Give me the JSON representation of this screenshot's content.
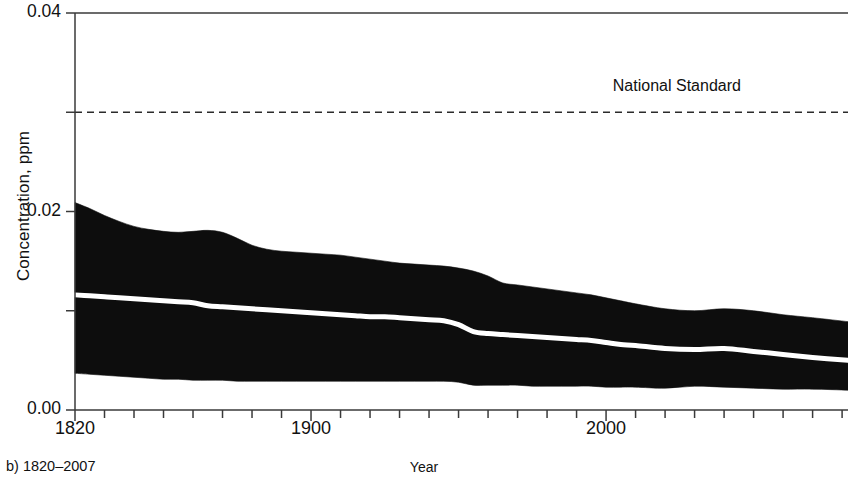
{
  "chart_data": {
    "type": "area",
    "title": "",
    "subtitle": "",
    "caption": "b) 1820–2007",
    "xlabel": "Year",
    "ylabel": "Concentration, ppm",
    "xlim": [
      1820,
      2082
    ],
    "ylim": [
      0.0,
      0.04
    ],
    "xticks_major": [
      1820,
      1900,
      2000
    ],
    "xtick_labels": [
      "1820",
      "1900",
      "2000"
    ],
    "xtick_minor_step": 10,
    "yticks_major": [
      0.0,
      0.02,
      0.04
    ],
    "ytick_labels": [
      "0.00",
      "0.02",
      "0.04"
    ],
    "yticks_minor": [
      0.01,
      0.03
    ],
    "grid": false,
    "legend_position": "none",
    "annotations": [
      {
        "label": "National Standard",
        "value": 0.03,
        "style": "dashed-horizontal-line",
        "label_x_year": 2005,
        "label_y_value": 0.0325
      }
    ],
    "series": [
      {
        "name": "Upper bound",
        "kind": "band-upper",
        "x": [
          1820,
          1825,
          1830,
          1835,
          1840,
          1845,
          1850,
          1855,
          1860,
          1865,
          1870,
          1875,
          1880,
          1885,
          1890,
          1895,
          1900,
          1905,
          1910,
          1915,
          1920,
          1925,
          1930,
          1935,
          1940,
          1945,
          1950,
          1955,
          1960,
          1965,
          1970,
          1975,
          1980,
          1985,
          1990,
          1995,
          2000,
          2005,
          2010,
          2020,
          2030,
          2040,
          2050,
          2060,
          2070,
          2082
        ],
        "values": [
          0.0209,
          0.0203,
          0.0196,
          0.019,
          0.0185,
          0.0182,
          0.018,
          0.0179,
          0.018,
          0.0181,
          0.0179,
          0.0173,
          0.0166,
          0.0162,
          0.016,
          0.0159,
          0.0158,
          0.0157,
          0.0156,
          0.0154,
          0.0152,
          0.015,
          0.0148,
          0.0147,
          0.0146,
          0.0145,
          0.0143,
          0.014,
          0.0135,
          0.0128,
          0.0126,
          0.0124,
          0.0122,
          0.012,
          0.0118,
          0.0116,
          0.0113,
          0.011,
          0.0107,
          0.0102,
          0.01,
          0.0102,
          0.01,
          0.0096,
          0.0093,
          0.0089
        ]
      },
      {
        "name": "Median",
        "kind": "band-median",
        "x": [
          1820,
          1825,
          1830,
          1835,
          1840,
          1845,
          1850,
          1855,
          1860,
          1865,
          1870,
          1875,
          1880,
          1885,
          1890,
          1895,
          1900,
          1905,
          1910,
          1915,
          1920,
          1925,
          1930,
          1935,
          1940,
          1945,
          1950,
          1955,
          1960,
          1965,
          1970,
          1975,
          1980,
          1985,
          1990,
          1995,
          2000,
          2005,
          2010,
          2020,
          2030,
          2040,
          2050,
          2060,
          2070,
          2082
        ],
        "values": [
          0.0116,
          0.0115,
          0.0114,
          0.0113,
          0.0112,
          0.0111,
          0.011,
          0.0109,
          0.0108,
          0.0105,
          0.0104,
          0.0103,
          0.0102,
          0.0101,
          0.01,
          0.0099,
          0.0098,
          0.0097,
          0.0096,
          0.0095,
          0.0094,
          0.0094,
          0.0093,
          0.0092,
          0.0091,
          0.009,
          0.0086,
          0.0079,
          0.0077,
          0.0076,
          0.0075,
          0.0074,
          0.0073,
          0.0072,
          0.0071,
          0.007,
          0.0068,
          0.0066,
          0.0065,
          0.0062,
          0.0061,
          0.0062,
          0.0059,
          0.0056,
          0.0053,
          0.005
        ]
      },
      {
        "name": "Lower bound",
        "kind": "band-lower",
        "x": [
          1820,
          1825,
          1830,
          1835,
          1840,
          1845,
          1850,
          1855,
          1860,
          1865,
          1870,
          1875,
          1880,
          1885,
          1890,
          1895,
          1900,
          1905,
          1910,
          1915,
          1920,
          1925,
          1930,
          1935,
          1940,
          1945,
          1950,
          1955,
          1960,
          1965,
          1970,
          1975,
          1980,
          1985,
          1990,
          1995,
          2000,
          2005,
          2010,
          2020,
          2030,
          2040,
          2050,
          2060,
          2070,
          2082
        ],
        "values": [
          0.0037,
          0.0036,
          0.0035,
          0.0034,
          0.0033,
          0.0032,
          0.0031,
          0.0031,
          0.003,
          0.003,
          0.003,
          0.0029,
          0.0029,
          0.0029,
          0.0029,
          0.0029,
          0.0029,
          0.0029,
          0.0029,
          0.0029,
          0.0029,
          0.0029,
          0.0029,
          0.0029,
          0.0029,
          0.0029,
          0.0028,
          0.0025,
          0.0025,
          0.0025,
          0.0025,
          0.0024,
          0.0024,
          0.0024,
          0.0024,
          0.0024,
          0.0023,
          0.0023,
          0.0023,
          0.0022,
          0.0024,
          0.0023,
          0.0022,
          0.0021,
          0.0021,
          0.002
        ]
      }
    ],
    "colors": {
      "band": "#0d0d0d",
      "median_line": "#ffffff",
      "axis": "#3a3a3a",
      "annotation_line": "#2b2b2b",
      "text": "#111111",
      "background": "#ffffff"
    }
  }
}
